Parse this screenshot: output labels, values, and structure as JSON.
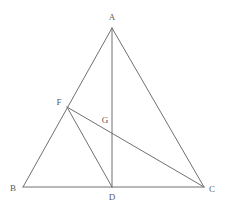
{
  "figure": {
    "type": "geometry-diagram",
    "width": 225,
    "height": 209,
    "background_color": "#ffffff",
    "stroke_color": "#707070",
    "label_color": "#5a5a5a",
    "stroke_width": 1
  },
  "points": {
    "A": {
      "label": "A",
      "x": 112,
      "y": 28,
      "label_x": 112,
      "label_y": 17
    },
    "B": {
      "label": "B",
      "x": 23,
      "y": 187,
      "label_x": 13,
      "label_y": 188
    },
    "C": {
      "label": "C",
      "x": 204,
      "y": 187,
      "label_x": 212,
      "label_y": 189
    },
    "D": {
      "label": "D",
      "x": 112,
      "y": 187,
      "label_x": 112,
      "label_y": 197
    },
    "F": {
      "label": "F",
      "x": 67,
      "y": 107,
      "label_x": 59,
      "label_y": 102
    },
    "G": {
      "label": "G",
      "x": 112,
      "y": 128,
      "label_x": 105,
      "label_y": 120
    }
  },
  "segments": [
    {
      "name": "segment-AB",
      "from": "A",
      "to": "B",
      "x1": 112,
      "y1": 28,
      "x2": 23,
      "y2": 187
    },
    {
      "name": "segment-AC",
      "from": "A",
      "to": "C",
      "x1": 112,
      "y1": 28,
      "x2": 204,
      "y2": 187
    },
    {
      "name": "segment-BC",
      "from": "B",
      "to": "C",
      "x1": 23,
      "y1": 187,
      "x2": 204,
      "y2": 187
    },
    {
      "name": "segment-AD",
      "from": "A",
      "to": "D",
      "x1": 112,
      "y1": 28,
      "x2": 112,
      "y2": 187
    },
    {
      "name": "segment-FD",
      "from": "F",
      "to": "D",
      "x1": 67,
      "y1": 107,
      "x2": 112,
      "y2": 187
    },
    {
      "name": "segment-FC",
      "from": "F",
      "to": "C",
      "x1": 67,
      "y1": 107,
      "x2": 204,
      "y2": 187
    }
  ]
}
